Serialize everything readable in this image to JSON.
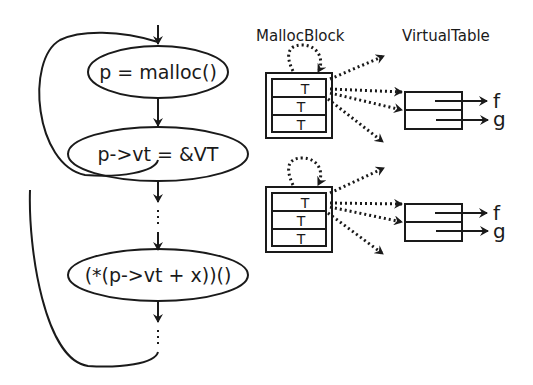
{
  "diagram": {
    "flow": {
      "nodes": [
        {
          "id": "malloc",
          "label": "p = malloc()"
        },
        {
          "id": "assign_vt",
          "label": "p->vt = &VT"
        },
        {
          "id": "vcall",
          "label": "(*(p->vt + x))()"
        }
      ],
      "ellipsis": [
        "⋮",
        "⋮"
      ]
    },
    "headers": {
      "malloc_block": "MallocBlock",
      "virtual_table": "VirtualTable"
    },
    "blocks": [
      {
        "cells": [
          "T",
          "T",
          "T"
        ],
        "vtable_entries": [
          "f",
          "g"
        ]
      },
      {
        "cells": [
          "T",
          "T",
          "T"
        ],
        "vtable_entries": [
          "f",
          "g"
        ]
      }
    ],
    "colors": {
      "stroke": "#1a1a1a",
      "background": "#ffffff"
    }
  }
}
